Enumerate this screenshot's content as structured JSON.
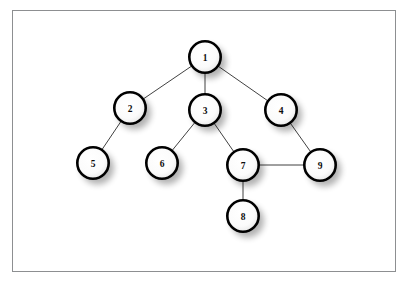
{
  "figure": {
    "background_color": "#ffffff",
    "frame": {
      "border_color": "#8d8f91",
      "fill_color": "#ffffff",
      "x": 12,
      "y": 10,
      "width": 384,
      "height": 262
    }
  },
  "chart_data": {
    "type": "diagram",
    "subtype": "node-link-graph",
    "title": "",
    "directed": false,
    "node_radius": 17,
    "node_style": {
      "fill": "#ffffff",
      "stroke": "#000000",
      "stroke_width": 2.6,
      "label_color": "#0c0c0c",
      "shadow_color": "#000000"
    },
    "edge_style": {
      "stroke": "#2b2b2b",
      "stroke_width": 0.9
    },
    "nodes": [
      {
        "id": "1",
        "label": "1",
        "x": 205,
        "y": 57
      },
      {
        "id": "2",
        "label": "2",
        "x": 130,
        "y": 108
      },
      {
        "id": "3",
        "label": "3",
        "x": 205,
        "y": 110
      },
      {
        "id": "4",
        "label": "4",
        "x": 281,
        "y": 110
      },
      {
        "id": "5",
        "label": "5",
        "x": 93,
        "y": 163
      },
      {
        "id": "6",
        "label": "6",
        "x": 162,
        "y": 163
      },
      {
        "id": "7",
        "label": "7",
        "x": 243,
        "y": 165
      },
      {
        "id": "8",
        "label": "8",
        "x": 243,
        "y": 216
      },
      {
        "id": "9",
        "label": "9",
        "x": 320,
        "y": 165
      }
    ],
    "edges": [
      {
        "source": "1",
        "target": "2"
      },
      {
        "source": "1",
        "target": "3"
      },
      {
        "source": "1",
        "target": "4"
      },
      {
        "source": "2",
        "target": "5"
      },
      {
        "source": "3",
        "target": "6"
      },
      {
        "source": "3",
        "target": "7"
      },
      {
        "source": "4",
        "target": "9"
      },
      {
        "source": "7",
        "target": "9"
      },
      {
        "source": "7",
        "target": "8"
      }
    ]
  }
}
